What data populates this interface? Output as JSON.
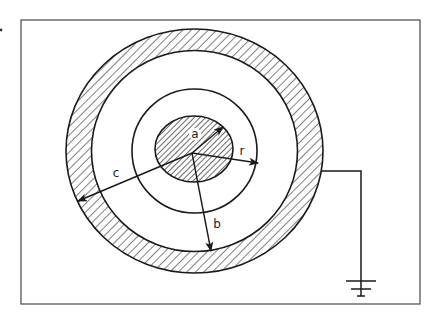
{
  "diagram": {
    "type": "coaxial-cross-section",
    "labels": {
      "a": "a",
      "b": "b",
      "c": "c",
      "r": "r"
    },
    "colors": {
      "stroke": "#1a1a1a",
      "frame": "#555555",
      "background": "#ffffff"
    },
    "components": [
      {
        "name": "inner-conductor",
        "hatched": true,
        "radius_label": "a"
      },
      {
        "name": "field-radius-circle",
        "hatched": false,
        "radius_label": "r"
      },
      {
        "name": "outer-conductor-shell",
        "hatched": true,
        "inner_radius_label": "b",
        "outer_radius_label": "c"
      },
      {
        "name": "ground-connection",
        "attached_to": "outer-conductor-shell"
      }
    ]
  }
}
